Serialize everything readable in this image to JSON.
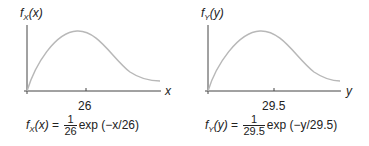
{
  "panels": [
    {
      "ylabel_f": "f",
      "ylabel_sub": "X",
      "ylabel_arg": "(x)",
      "xlabel": "x",
      "tick": "26",
      "formula": {
        "lhs_f": "f",
        "lhs_sub": "X",
        "lhs_arg": "(x)",
        "eq": "=",
        "num": "1",
        "den": "26",
        "rhs": "exp (−x/26)"
      }
    },
    {
      "ylabel_f": "f",
      "ylabel_sub": "Y",
      "ylabel_arg": "(y)",
      "xlabel": "y",
      "tick": "29.5",
      "formula": {
        "lhs_f": "f",
        "lhs_sub": "Y",
        "lhs_arg": "(y)",
        "eq": "=",
        "num": "1",
        "den": "29.5",
        "rhs": "exp (−y/29.5)"
      }
    }
  ],
  "colors": {
    "axis": "#444444",
    "curve": "#b8b8b8"
  }
}
